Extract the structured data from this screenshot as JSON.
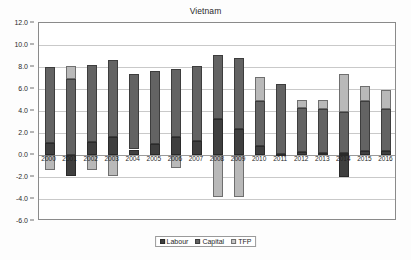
{
  "chart_data": {
    "type": "bar",
    "title": "Vietnam",
    "xlabel": "",
    "ylabel": "",
    "ylim": [
      -6.0,
      12.0
    ],
    "ytick_step": 2.0,
    "ytick_labels": [
      "12.0",
      "10.0",
      "8.0",
      "6.0",
      "4.0",
      "2.0",
      "0.0",
      "-2.0",
      "-4.0",
      "-6.0"
    ],
    "ytick_values": [
      12.0,
      10.0,
      8.0,
      6.0,
      4.0,
      2.0,
      0.0,
      -2.0,
      -4.0,
      -6.0
    ],
    "grid": true,
    "stacked": true,
    "legend_position": "bottom-center",
    "categories": [
      "2000",
      "2001",
      "2002",
      "2003",
      "2004",
      "2005",
      "2006",
      "2007",
      "2008",
      "2009",
      "2010",
      "2011",
      "2012",
      "2013",
      "2014",
      "2015",
      "2016"
    ],
    "series": [
      {
        "name": "Labour",
        "color": "#3f3f3f",
        "values": [
          1.1,
          0.0,
          1.2,
          1.6,
          0.5,
          1.0,
          1.6,
          1.3,
          3.3,
          2.4,
          0.8,
          0.1,
          0.3,
          0.2,
          0.2,
          0.4,
          0.4
        ]
      },
      {
        "name": "Capital",
        "color": "#636363",
        "values": [
          6.9,
          6.9,
          7.0,
          7.0,
          6.9,
          6.6,
          6.2,
          6.8,
          5.8,
          6.4,
          4.1,
          6.4,
          4.0,
          4.0,
          3.7,
          4.5,
          3.8
        ]
      },
      {
        "name": "TFP",
        "color": "#b9b9b9",
        "values": [
          -1.4,
          1.2,
          -1.4,
          -1.9,
          0.0,
          0.0,
          -1.2,
          0.0,
          -3.8,
          -3.8,
          2.2,
          0.0,
          0.7,
          0.8,
          3.5,
          1.4,
          1.7
        ]
      }
    ],
    "negative_overrides": [
      {
        "category": "2001",
        "series": "Labour",
        "value": -1.9
      },
      {
        "category": "2014",
        "series": "Labour",
        "value": -2.0
      }
    ],
    "totals": [
      8.0,
      8.1,
      8.2,
      8.6,
      7.4,
      7.6,
      7.8,
      8.1,
      9.1,
      8.8,
      7.1,
      6.5,
      5.0,
      5.0,
      7.4,
      6.3,
      5.9
    ]
  },
  "legend": {
    "items": [
      {
        "label": "Labour",
        "key": "labour"
      },
      {
        "label": "Capital",
        "key": "capital"
      },
      {
        "label": "TFP",
        "key": "tfp"
      }
    ]
  }
}
